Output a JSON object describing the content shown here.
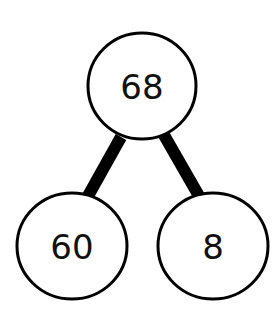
{
  "diagram": {
    "type": "number-bond",
    "whole": {
      "label": "68"
    },
    "parts": [
      {
        "label": "60"
      },
      {
        "label": "8"
      }
    ],
    "colors": {
      "stroke": "#000000",
      "fill": "#ffffff",
      "text": "#111111"
    }
  }
}
